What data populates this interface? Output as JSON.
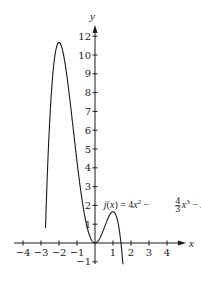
{
  "chart_data": {
    "type": "line",
    "title": "",
    "xlabel": "x",
    "ylabel": "y",
    "xlim": [
      -4.3,
      4.8
    ],
    "ylim": [
      -1.1,
      12.5
    ],
    "grid": false,
    "legend": "none",
    "function": "j(x) = 4x^2 - (4/3)x^3 - x^4",
    "annotation": {
      "text_parts": [
        "j(x) = 4x",
        "2",
        " − ",
        "4",
        "3",
        "x",
        "3",
        " − x",
        "4"
      ],
      "anchor_x": 0.6,
      "anchor_y": 2.0
    },
    "x_ticks": [
      -4,
      -3,
      -2,
      -1,
      1,
      2,
      3,
      4
    ],
    "x_tick_labels": [
      "−4",
      "−3",
      "−2",
      "−1",
      "1",
      "2",
      "3",
      "4"
    ],
    "y_ticks": [
      -1,
      1,
      2,
      3,
      4,
      5,
      6,
      7,
      8,
      9,
      10,
      11
    ],
    "y_tick_labels": [
      "−1",
      "1",
      "2",
      "3",
      "4",
      "5",
      "6",
      "7",
      "8",
      "9",
      "10",
      "12"
    ],
    "series": [
      {
        "name": "j(x)",
        "x": [
          -2.75,
          -2.6,
          -2.5,
          -2.4,
          -2.3,
          -2.2,
          -2.1,
          -2.0,
          -1.9,
          -1.8,
          -1.6,
          -1.4,
          -1.2,
          -1.0,
          -0.8,
          -0.6,
          -0.4,
          -0.2,
          0.0,
          0.2,
          0.4,
          0.6,
          0.8,
          1.0,
          1.1,
          1.2,
          1.3,
          1.4,
          1.5,
          1.55
        ],
        "values": [
          -1.2,
          2.76,
          4.79,
          6.45,
          7.76,
          8.73,
          9.39,
          10.67,
          10.68,
          10.27,
          9.04,
          7.5,
          5.74,
          4.33,
          3.0,
          1.6,
          0.7,
          0.17,
          0.0,
          0.15,
          0.53,
          0.98,
          1.33,
          1.67,
          1.61,
          1.39,
          0.97,
          0.32,
          -0.56,
          -1.1
        ]
      }
    ],
    "extrema": [
      {
        "x": -2,
        "y": 10.67,
        "kind": "max"
      },
      {
        "x": 0,
        "y": 0,
        "kind": "min"
      },
      {
        "x": 1,
        "y": 1.67,
        "kind": "max"
      }
    ]
  }
}
